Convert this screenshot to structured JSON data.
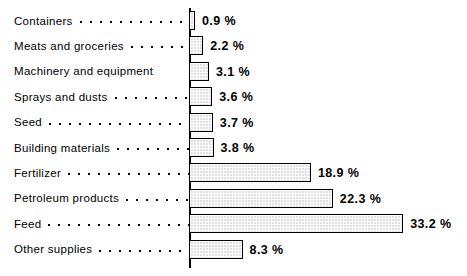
{
  "chart_data": {
    "type": "bar",
    "orientation": "horizontal",
    "title": "",
    "xlabel": "",
    "ylabel": "",
    "grid": false,
    "legend": false,
    "value_suffix": "%",
    "xlim": [
      0,
      33.2
    ],
    "categories": [
      "Containers",
      "Meats and groceries",
      "Machinery and equipment",
      "Sprays and dusts",
      "Seed",
      "Building materials",
      "Fertilizer",
      "Petroleum products",
      "Feed",
      "Other supplies"
    ],
    "values": [
      0.9,
      2.2,
      3.1,
      3.6,
      3.7,
      3.8,
      18.9,
      22.3,
      33.2,
      8.3
    ],
    "value_labels": [
      "0.9 %",
      "2.2 %",
      "3.1 %",
      "3.6 %",
      "3.7 %",
      "3.8 %",
      "18.9 %",
      "22.3 %",
      "33.2 %",
      "8.3 %"
    ],
    "leader_dots": [
      true,
      true,
      false,
      true,
      true,
      true,
      true,
      true,
      true,
      true
    ],
    "colors": {
      "background": "#ffffff",
      "bar_fill": "#e0e0e0",
      "bar_pattern": "#ffffff",
      "bar_border": "#000000",
      "text": "#000000",
      "axis": "#000000"
    }
  }
}
